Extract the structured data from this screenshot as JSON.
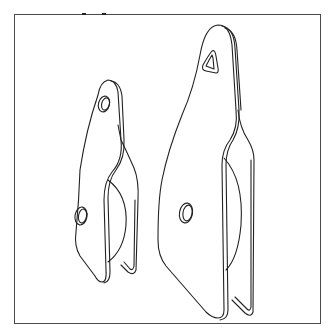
{
  "figure": {
    "parts": [
      {
        "name": "small-block",
        "top_hole": "round",
        "side_hole": "round"
      },
      {
        "name": "large-block",
        "top_hole": "triangular",
        "side_hole": "round"
      }
    ],
    "colors": {
      "line": "#222222",
      "frame": "#4a4a4a",
      "background": "#ffffff"
    }
  }
}
